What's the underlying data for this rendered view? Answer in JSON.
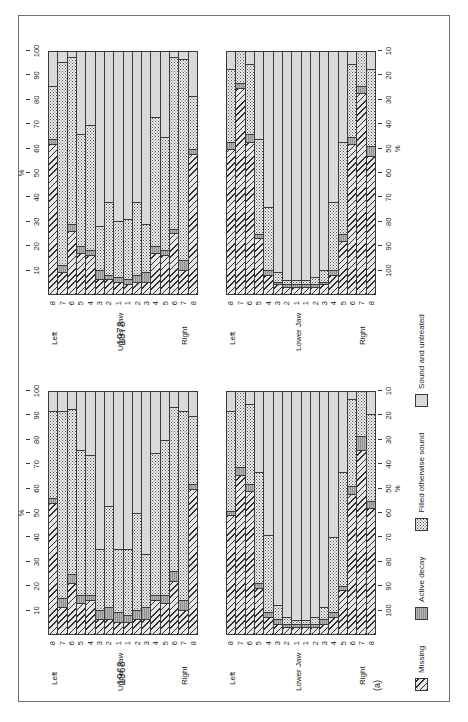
{
  "figure": {
    "panel_label": "(a)",
    "axis_percent_symbol": "%",
    "side_left": "Left",
    "side_right": "Right",
    "jaw_upper": "Upper Jaw",
    "jaw_lower": "Lower Jaw",
    "tooth_labels": [
      "8",
      "7",
      "6",
      "5",
      "4",
      "3",
      "2",
      "1",
      "1",
      "2",
      "3",
      "4",
      "5",
      "6",
      "7",
      "8"
    ],
    "ticks_ascending": [
      "10",
      "20",
      "30",
      "40",
      "50",
      "60",
      "70",
      "80",
      "90",
      "100"
    ],
    "ticks_descending": [
      "100",
      "90",
      "80",
      "70",
      "60",
      "50",
      "40",
      "30",
      "20",
      "10"
    ]
  },
  "legend": {
    "items": [
      {
        "label": "Missing",
        "pattern": "diagonal-hatch",
        "color": "#e8e8e8"
      },
      {
        "label": "Active decay",
        "pattern": "solid-gray",
        "color": "#8f8f8f"
      },
      {
        "label": "Filled otherwise sound",
        "pattern": "dotted",
        "color": "#f2f2f2"
      },
      {
        "label": "Sound and untreated",
        "pattern": "light-gray",
        "color": "#d9d9d9"
      }
    ]
  },
  "chart_data": {
    "type": "bar",
    "subtype": "stacked-horizontal-100pct",
    "xlabel": "%",
    "ylabel": "Tooth",
    "xlim": [
      0,
      100
    ],
    "grid": false,
    "legend_position": "bottom",
    "categories": [
      "8",
      "7",
      "6",
      "5",
      "4",
      "3",
      "2",
      "1",
      "1",
      "2",
      "3",
      "4",
      "5",
      "6",
      "7",
      "8"
    ],
    "series_names": [
      "Missing",
      "Active decay",
      "Filled otherwise sound",
      "Sound and untreated"
    ],
    "charts": [
      {
        "year": "1968",
        "jaw": "Upper Jaw",
        "side_order": "Left 8..1 then Right 1..8",
        "rows": [
          {
            "tooth": "8",
            "side": "Left",
            "missing": 54,
            "decay": 2,
            "filled": 36,
            "sound": 8
          },
          {
            "tooth": "7",
            "side": "Left",
            "missing": 11,
            "decay": 4,
            "filled": 77,
            "sound": 8
          },
          {
            "tooth": "6",
            "side": "Left",
            "missing": 21,
            "decay": 4,
            "filled": 68,
            "sound": 7
          },
          {
            "tooth": "5",
            "side": "Left",
            "missing": 13,
            "decay": 3,
            "filled": 60,
            "sound": 24
          },
          {
            "tooth": "4",
            "side": "Left",
            "missing": 14,
            "decay": 2,
            "filled": 58,
            "sound": 26
          },
          {
            "tooth": "3",
            "side": "Left",
            "missing": 6,
            "decay": 4,
            "filled": 25,
            "sound": 65
          },
          {
            "tooth": "2",
            "side": "Left",
            "missing": 6,
            "decay": 5,
            "filled": 42,
            "sound": 47
          },
          {
            "tooth": "1",
            "side": "Left",
            "missing": 5,
            "decay": 4,
            "filled": 26,
            "sound": 65
          },
          {
            "tooth": "1",
            "side": "Right",
            "missing": 5,
            "decay": 3,
            "filled": 27,
            "sound": 65
          },
          {
            "tooth": "2",
            "side": "Right",
            "missing": 6,
            "decay": 4,
            "filled": 40,
            "sound": 50
          },
          {
            "tooth": "3",
            "side": "Right",
            "missing": 6,
            "decay": 5,
            "filled": 22,
            "sound": 67
          },
          {
            "tooth": "4",
            "side": "Right",
            "missing": 14,
            "decay": 2,
            "filled": 59,
            "sound": 25
          },
          {
            "tooth": "5",
            "side": "Right",
            "missing": 13,
            "decay": 3,
            "filled": 64,
            "sound": 20
          },
          {
            "tooth": "6",
            "side": "Right",
            "missing": 22,
            "decay": 4,
            "filled": 68,
            "sound": 6
          },
          {
            "tooth": "7",
            "side": "Right",
            "missing": 10,
            "decay": 4,
            "filled": 78,
            "sound": 8
          },
          {
            "tooth": "8",
            "side": "Right",
            "missing": 60,
            "decay": 2,
            "filled": 28,
            "sound": 10
          }
        ]
      },
      {
        "year": "1968",
        "jaw": "Lower Jaw",
        "side_order": "Left 8..1 then Right 1..8",
        "rows": [
          {
            "tooth": "8",
            "side": "Left",
            "missing": 49,
            "decay": 2,
            "filled": 41,
            "sound": 8
          },
          {
            "tooth": "7",
            "side": "Left",
            "missing": 80,
            "decay": 4,
            "filled": 38,
            "sound": 0
          },
          {
            "tooth": "6",
            "side": "Left",
            "missing": 59,
            "decay": 3,
            "filled": 33,
            "sound": 5
          },
          {
            "tooth": "5",
            "side": "Left",
            "missing": 19,
            "decay": 2,
            "filled": 46,
            "sound": 33
          },
          {
            "tooth": "4",
            "side": "Left",
            "missing": 7,
            "decay": 2,
            "filled": 32,
            "sound": 59
          },
          {
            "tooth": "3",
            "side": "Left",
            "missing": 4,
            "decay": 2,
            "filled": 6,
            "sound": 88
          },
          {
            "tooth": "2",
            "side": "Left",
            "missing": 3,
            "decay": 1,
            "filled": 3,
            "sound": 93
          },
          {
            "tooth": "1",
            "side": "Left",
            "missing": 3,
            "decay": 1,
            "filled": 2,
            "sound": 94
          },
          {
            "tooth": "1",
            "side": "Right",
            "missing": 3,
            "decay": 1,
            "filled": 2,
            "sound": 94
          },
          {
            "tooth": "2",
            "side": "Right",
            "missing": 3,
            "decay": 1,
            "filled": 3,
            "sound": 93
          },
          {
            "tooth": "3",
            "side": "Right",
            "missing": 4,
            "decay": 2,
            "filled": 5,
            "sound": 89
          },
          {
            "tooth": "4",
            "side": "Right",
            "missing": 7,
            "decay": 2,
            "filled": 31,
            "sound": 60
          },
          {
            "tooth": "5",
            "side": "Right",
            "missing": 18,
            "decay": 2,
            "filled": 47,
            "sound": 33
          },
          {
            "tooth": "6",
            "side": "Right",
            "missing": 58,
            "decay": 3,
            "filled": 36,
            "sound": 3
          },
          {
            "tooth": "7",
            "side": "Right",
            "missing": 76,
            "decay": 6,
            "filled": 18,
            "sound": 0
          },
          {
            "tooth": "8",
            "side": "Right",
            "missing": 52,
            "decay": 3,
            "filled": 36,
            "sound": 9
          }
        ]
      },
      {
        "year": "1978",
        "jaw": "Upper Jaw",
        "side_order": "Left 8..1 then Right 1..8",
        "rows": [
          {
            "tooth": "8",
            "side": "Left",
            "missing": 62,
            "decay": 2,
            "filled": 22,
            "sound": 14
          },
          {
            "tooth": "7",
            "side": "Left",
            "missing": 9,
            "decay": 3,
            "filled": 84,
            "sound": 4
          },
          {
            "tooth": "6",
            "side": "Left",
            "missing": 26,
            "decay": 3,
            "filled": 69,
            "sound": 2
          },
          {
            "tooth": "5",
            "side": "Left",
            "missing": 17,
            "decay": 3,
            "filled": 46,
            "sound": 34
          },
          {
            "tooth": "4",
            "side": "Left",
            "missing": 16,
            "decay": 2,
            "filled": 52,
            "sound": 30
          },
          {
            "tooth": "3",
            "side": "Left",
            "missing": 6,
            "decay": 4,
            "filled": 18,
            "sound": 72
          },
          {
            "tooth": "2",
            "side": "Left",
            "missing": 6,
            "decay": 2,
            "filled": 30,
            "sound": 62
          },
          {
            "tooth": "1",
            "side": "Left",
            "missing": 5,
            "decay": 2,
            "filled": 23,
            "sound": 70
          },
          {
            "tooth": "1",
            "side": "Right",
            "missing": 4,
            "decay": 2,
            "filled": 25,
            "sound": 69
          },
          {
            "tooth": "2",
            "side": "Right",
            "missing": 5,
            "decay": 3,
            "filled": 30,
            "sound": 62
          },
          {
            "tooth": "3",
            "side": "Right",
            "missing": 5,
            "decay": 4,
            "filled": 20,
            "sound": 71
          },
          {
            "tooth": "4",
            "side": "Right",
            "missing": 17,
            "decay": 3,
            "filled": 53,
            "sound": 27
          },
          {
            "tooth": "5",
            "side": "Right",
            "missing": 16,
            "decay": 2,
            "filled": 47,
            "sound": 35
          },
          {
            "tooth": "6",
            "side": "Right",
            "missing": 25,
            "decay": 2,
            "filled": 71,
            "sound": 2
          },
          {
            "tooth": "7",
            "side": "Right",
            "missing": 10,
            "decay": 4,
            "filled": 83,
            "sound": 3
          },
          {
            "tooth": "8",
            "side": "Right",
            "missing": 58,
            "decay": 2,
            "filled": 22,
            "sound": 18
          }
        ]
      },
      {
        "year": "1978",
        "jaw": "Lower Jaw",
        "side_order": "Left 8..1 then Right 1..8",
        "rows": [
          {
            "tooth": "8",
            "side": "Left",
            "missing": 60,
            "decay": 3,
            "filled": 30,
            "sound": 7
          },
          {
            "tooth": "7",
            "side": "Left",
            "missing": 85,
            "decay": 2,
            "filled": 13,
            "sound": 0
          },
          {
            "tooth": "6",
            "side": "Left",
            "missing": 63,
            "decay": 3,
            "filled": 29,
            "sound": 5
          },
          {
            "tooth": "5",
            "side": "Left",
            "missing": 23,
            "decay": 2,
            "filled": 39,
            "sound": 36
          },
          {
            "tooth": "4",
            "side": "Left",
            "missing": 8,
            "decay": 2,
            "filled": 26,
            "sound": 64
          },
          {
            "tooth": "3",
            "side": "Left",
            "missing": 4,
            "decay": 1,
            "filled": 4,
            "sound": 91
          },
          {
            "tooth": "2",
            "side": "Left",
            "missing": 3,
            "decay": 1,
            "filled": 2,
            "sound": 94
          },
          {
            "tooth": "1",
            "side": "Left",
            "missing": 3,
            "decay": 1,
            "filled": 2,
            "sound": 94
          },
          {
            "tooth": "1",
            "side": "Right",
            "missing": 3,
            "decay": 1,
            "filled": 2,
            "sound": 94
          },
          {
            "tooth": "2",
            "side": "Right",
            "missing": 3,
            "decay": 1,
            "filled": 3,
            "sound": 93
          },
          {
            "tooth": "3",
            "side": "Right",
            "missing": 4,
            "decay": 1,
            "filled": 5,
            "sound": 90
          },
          {
            "tooth": "4",
            "side": "Right",
            "missing": 8,
            "decay": 2,
            "filled": 28,
            "sound": 62
          },
          {
            "tooth": "5",
            "side": "Right",
            "missing": 22,
            "decay": 3,
            "filled": 38,
            "sound": 37
          },
          {
            "tooth": "6",
            "side": "Right",
            "missing": 62,
            "decay": 3,
            "filled": 30,
            "sound": 5
          },
          {
            "tooth": "7",
            "side": "Right",
            "missing": 83,
            "decay": 3,
            "filled": 14,
            "sound": 0
          },
          {
            "tooth": "8",
            "side": "Right",
            "missing": 57,
            "decay": 4,
            "filled": 32,
            "sound": 7
          }
        ]
      }
    ]
  }
}
